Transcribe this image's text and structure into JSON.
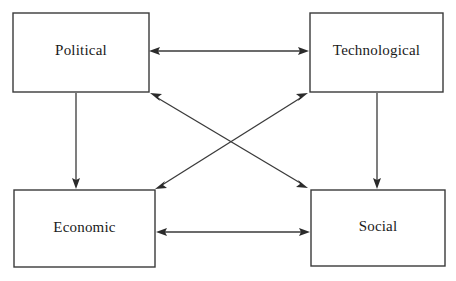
{
  "diagram": {
    "type": "node-link-diagram",
    "background_color": "#ffffff",
    "line_color": "#3a3a3a",
    "text_color": "#1a1a1a",
    "nodes": [
      {
        "id": "political",
        "label": "Political",
        "x": 13,
        "y": 13,
        "width": 136,
        "height": 79
      },
      {
        "id": "technological",
        "label": "Technological",
        "x": 310,
        "y": 13,
        "width": 133,
        "height": 79
      },
      {
        "id": "economic",
        "label": "Economic",
        "x": 14,
        "y": 190,
        "width": 141,
        "height": 77
      },
      {
        "id": "social",
        "label": "Social",
        "x": 311,
        "y": 190,
        "width": 134,
        "height": 76
      }
    ],
    "links": [
      {
        "id": "political-technological",
        "from": "political",
        "to": "technological",
        "direction": "bidirectional",
        "x1": 149,
        "y1": 51,
        "x2": 309,
        "y2": 51
      },
      {
        "id": "economic-social",
        "from": "economic",
        "to": "social",
        "direction": "bidirectional",
        "x1": 156,
        "y1": 232,
        "x2": 310,
        "y2": 232
      },
      {
        "id": "political-economic",
        "from": "political",
        "to": "economic",
        "direction": "unidirectional",
        "x1": 76,
        "y1": 93,
        "x2": 76,
        "y2": 189
      },
      {
        "id": "technological-social",
        "from": "technological",
        "to": "social",
        "direction": "unidirectional",
        "x1": 377,
        "y1": 93,
        "x2": 377,
        "y2": 189
      },
      {
        "id": "political-social",
        "from": "political",
        "to": "social",
        "direction": "bidirectional",
        "x1": 150,
        "y1": 93,
        "x2": 308,
        "y2": 188
      },
      {
        "id": "technological-economic",
        "from": "technological",
        "to": "economic",
        "direction": "bidirectional",
        "x1": 308,
        "y1": 93,
        "x2": 155,
        "y2": 189
      }
    ]
  }
}
